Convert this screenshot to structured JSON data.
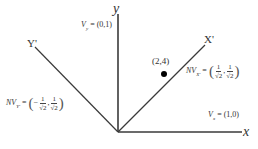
{
  "diagram": {
    "axes": {
      "x_label": "x",
      "y_label": "y",
      "x_prime_label": "X'",
      "y_prime_label": "Y'"
    },
    "vectors": {
      "vy": {
        "name": "V",
        "sub": "y",
        "value": "= (0,1)"
      },
      "vx": {
        "name": "V",
        "sub": "x",
        "value": "= (1,0)"
      },
      "nvx": {
        "name": "NV",
        "sub": "X'",
        "eq": "=",
        "c1_num": "1",
        "c1_den": "√2",
        "c2_num": "1",
        "c2_den": "√2",
        "sep": ",",
        "c1_sign": ""
      },
      "nvy": {
        "name": "NV",
        "sub": "Y'",
        "eq": "=",
        "c1_num": "1",
        "c1_den": "√2",
        "c2_num": "1",
        "c2_den": "√2",
        "sep": ",",
        "c1_sign": "−"
      }
    },
    "point": {
      "label": "(2,4)"
    },
    "colors": {
      "line": "#3a3a3a",
      "point": "#000000",
      "text": "#333333"
    }
  }
}
